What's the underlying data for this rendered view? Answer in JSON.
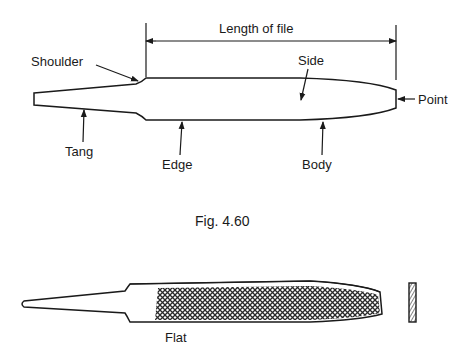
{
  "figure": {
    "caption": "Fig. 4.60",
    "dimension_label": "Length of file",
    "parts": {
      "shoulder": "Shoulder",
      "side": "Side",
      "point": "Point",
      "tang": "Tang",
      "edge": "Edge",
      "body": "Body"
    },
    "flat_file_label": "Flat"
  },
  "colors": {
    "ink": "#1a1a1a",
    "background": "#ffffff"
  }
}
